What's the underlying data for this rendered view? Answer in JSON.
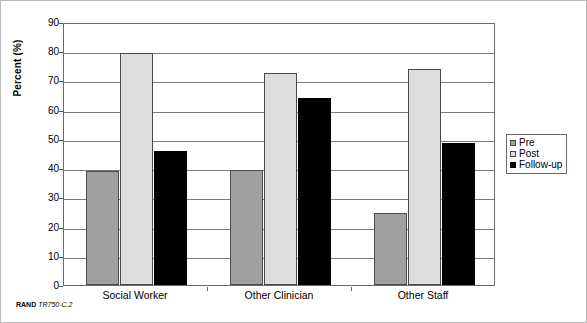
{
  "chart_data": {
    "type": "bar",
    "title": "",
    "xlabel": "",
    "ylabel": "Percent (%)",
    "ylim": [
      0,
      90
    ],
    "ytick_step": 10,
    "yticks": [
      0,
      10,
      20,
      30,
      40,
      50,
      60,
      70,
      80,
      90
    ],
    "grid": true,
    "legend_position": "right",
    "categories": [
      "Social Worker",
      "Other Clinician",
      "Other Staff"
    ],
    "series": [
      {
        "name": "Pre",
        "color": "#a0a0a0",
        "values": [
          39,
          39.5,
          24.5
        ]
      },
      {
        "name": "Post",
        "color": "#dedede",
        "values": [
          79.5,
          72.5,
          74
        ]
      },
      {
        "name": "Follow-up",
        "color": "#000000",
        "values": [
          46,
          64,
          48.5
        ]
      }
    ]
  },
  "legend": {
    "items": [
      {
        "label": "Pre"
      },
      {
        "label": "Post"
      },
      {
        "label": "Follow-up"
      }
    ]
  },
  "caption": {
    "brand": "RAND",
    "code": "TR750-C.2"
  }
}
